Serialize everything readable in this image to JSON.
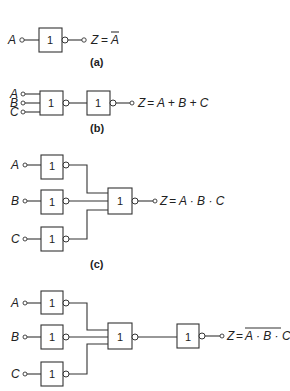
{
  "figure": {
    "a": {
      "caption": "(a)",
      "input": "A",
      "gate_label": "1",
      "output_lhs": "Z",
      "output_eq": "=",
      "output_rhs": "A",
      "output_rhs_overbar": true
    },
    "b": {
      "caption": "(b)",
      "inputs": [
        "A",
        "B",
        "C"
      ],
      "gate1_label": "1",
      "gate2_label": "1",
      "output_lhs": "Z",
      "output_expr": "= A + B + C"
    },
    "c": {
      "caption": "(c)",
      "inputs": [
        "A",
        "B",
        "C"
      ],
      "input_gate_label": "1",
      "main_gate_label": "1",
      "output_lhs": "Z",
      "output_expr": "= A · B · C"
    },
    "d": {
      "inputs": [
        "A",
        "B",
        "C"
      ],
      "input_gate_label": "1",
      "main_gate_label": "1",
      "final_gate_label": "1",
      "output_lhs": "Z",
      "output_eq": "=",
      "output_rhs": "A · B · C",
      "output_rhs_overbar": true
    }
  }
}
